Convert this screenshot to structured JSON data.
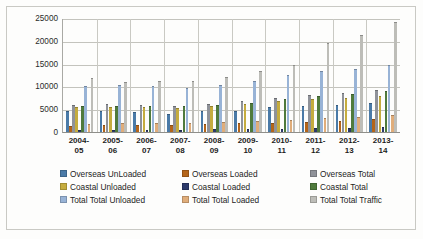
{
  "chart_data": {
    "type": "bar",
    "title": "",
    "xlabel": "",
    "ylabel": "",
    "ylim": [
      0,
      25000
    ],
    "yticks": [
      "0",
      "5000",
      "10000",
      "15000",
      "20000",
      "25000"
    ],
    "grid": true,
    "legend_position": "bottom",
    "categories": [
      "2004-\n05",
      "2005-\n06",
      "2006-\n07",
      "2007-\n08",
      "2008-\n09",
      "2009-\n10",
      "2010-\n11",
      "2011-\n12",
      "2012-\n13",
      "2013-\n14"
    ],
    "category_labels": [
      {
        "line1": "2004-",
        "line2": "05"
      },
      {
        "line1": "2005-",
        "line2": "06"
      },
      {
        "line1": "2006-",
        "line2": "07"
      },
      {
        "line1": "2007-",
        "line2": "08"
      },
      {
        "line1": "2008-",
        "line2": "09"
      },
      {
        "line1": "2009-",
        "line2": "10"
      },
      {
        "line1": "2010-",
        "line2": "11"
      },
      {
        "line1": "2011-",
        "line2": "12"
      },
      {
        "line1": "2012-",
        "line2": "13"
      },
      {
        "line1": "2013-",
        "line2": "14"
      }
    ],
    "series": [
      {
        "name": "Overseas UnLoaded",
        "color": "#4a7aa7",
        "values": [
          4700,
          4600,
          4400,
          4000,
          4500,
          4700,
          5400,
          5800,
          5900,
          6400
        ]
      },
      {
        "name": "Overseas Loaded",
        "color": "#b4651a",
        "values": [
          1400,
          1500,
          1500,
          1500,
          1700,
          1900,
          2000,
          2300,
          2500,
          2800
        ]
      },
      {
        "name": "Overseas Total",
        "color": "#8f9299",
        "values": [
          6000,
          6100,
          6000,
          5600,
          6200,
          6700,
          7500,
          8200,
          8500,
          9300
        ]
      },
      {
        "name": "Coastal Unloaded",
        "color": "#c5ac3e",
        "values": [
          5400,
          5500,
          5400,
          5300,
          5600,
          6100,
          6800,
          7300,
          7500,
          7900
        ]
      },
      {
        "name": "Coastal Loaded",
        "color": "#2d3a6b",
        "values": [
          500,
          550,
          520,
          500,
          560,
          620,
          700,
          800,
          900,
          1000
        ]
      },
      {
        "name": "Coastal Total",
        "color": "#4f7a3c",
        "values": [
          5700,
          5800,
          5700,
          5600,
          6000,
          6400,
          7200,
          7900,
          8400,
          8900
        ]
      },
      {
        "name": "Total Total Unloaded",
        "color": "#98b3d6",
        "values": [
          10200,
          10300,
          10000,
          9600,
          10400,
          11200,
          12400,
          13400,
          13800,
          14800
        ]
      },
      {
        "name": "Total Total Loaded",
        "color": "#e0ad7a",
        "values": [
          1800,
          1900,
          1900,
          1900,
          2100,
          2400,
          2700,
          3000,
          3400,
          3700
        ]
      },
      {
        "name": "Total Total Traffic",
        "color": "#bdbdb8",
        "values": [
          11900,
          11000,
          11200,
          11200,
          12000,
          13300,
          14800,
          19500,
          21200,
          24100
        ]
      }
    ]
  },
  "axis": {
    "y_ticks": [
      {
        "label": "25000",
        "value": 25000
      },
      {
        "label": "20000",
        "value": 20000
      },
      {
        "label": "15000",
        "value": 15000
      },
      {
        "label": "10000",
        "value": 10000
      },
      {
        "label": "5000",
        "value": 5000
      },
      {
        "label": "0",
        "value": 0
      }
    ]
  },
  "legend": {
    "rows": [
      [
        {
          "label": "Overseas UnLoaded",
          "color": "#4a7aa7"
        },
        {
          "label": "Overseas Loaded",
          "color": "#b4651a"
        },
        {
          "label": "Overseas Total",
          "color": "#8f9299"
        }
      ],
      [
        {
          "label": "Coastal Unloaded",
          "color": "#c5ac3e"
        },
        {
          "label": "Coastal Loaded",
          "color": "#2d3a6b"
        },
        {
          "label": "Coastal Total",
          "color": "#4f7a3c"
        }
      ],
      [
        {
          "label": "Total Total Unloaded",
          "color": "#98b3d6"
        },
        {
          "label": "Total Total Loaded",
          "color": "#e0ad7a"
        },
        {
          "label": "Total Total Traffic",
          "color": "#bdbdb8"
        }
      ]
    ]
  }
}
